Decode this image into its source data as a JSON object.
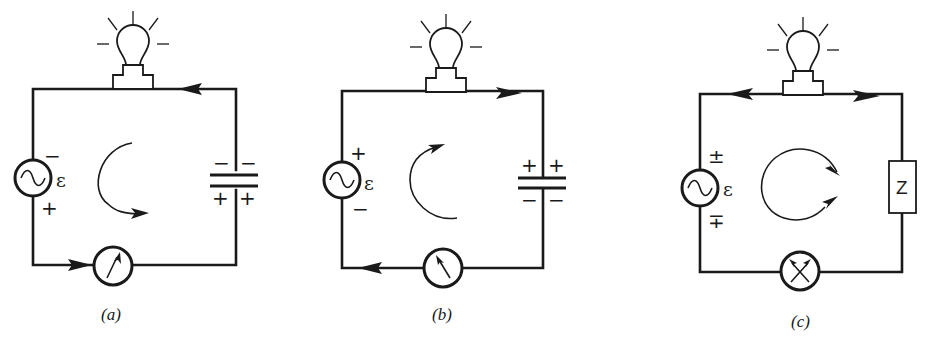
{
  "figure": {
    "colors": {
      "ink": "#1a1a1a",
      "background": "#ffffff"
    },
    "panels": [
      {
        "id": "a",
        "caption": "(a)",
        "source": {
          "icon": "ac-source-icon",
          "label": "ε",
          "top_sign": "−",
          "bottom_sign": "+"
        },
        "load": {
          "type": "capacitor",
          "top_signs": [
            "−",
            "−"
          ],
          "bottom_signs": [
            "+",
            "+"
          ]
        },
        "meter": {
          "icon": "ammeter-icon",
          "needle": "right"
        },
        "wire_arrows": [
          "top-wire: leftward",
          "bottom-wire: rightward"
        ],
        "current_loop": "counterclockwise"
      },
      {
        "id": "b",
        "caption": "(b)",
        "source": {
          "icon": "ac-source-icon",
          "label": "ε",
          "top_sign": "+",
          "bottom_sign": "−"
        },
        "load": {
          "type": "capacitor",
          "top_signs": [
            "+",
            "+"
          ],
          "bottom_signs": [
            "−",
            "−"
          ]
        },
        "meter": {
          "icon": "ammeter-icon",
          "needle": "left"
        },
        "wire_arrows": [
          "top-wire: rightward",
          "bottom-wire: leftward"
        ],
        "current_loop": "clockwise"
      },
      {
        "id": "c",
        "caption": "(c)",
        "source": {
          "icon": "ac-source-icon",
          "label": "ε",
          "top_sign": "±",
          "bottom_sign": "∓"
        },
        "load": {
          "type": "impedance",
          "label": "Z"
        },
        "meter": {
          "icon": "ammeter-icon",
          "needle": "both"
        },
        "wire_arrows": [
          "top-wire: leftward",
          "top-wire: rightward"
        ],
        "current_loop": "alternating"
      }
    ]
  }
}
